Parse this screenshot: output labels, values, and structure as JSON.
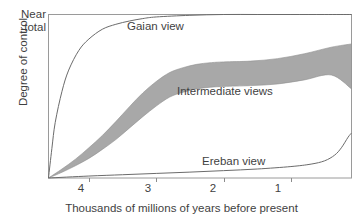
{
  "chart_data": {
    "type": "line",
    "title": "",
    "xlabel": "Thousands of millions of years before present",
    "ylabel": "Degree of control",
    "y_top_label": "Near total",
    "xticks": [
      4,
      3,
      2,
      1
    ],
    "xtick_labels": [
      "4",
      "3",
      "2",
      "1"
    ],
    "x_axis_direction": "decreasing",
    "xlim": [
      4.6,
      0.1
    ],
    "ylim": [
      0,
      1
    ],
    "grid": false,
    "legend_position": "inline-annotations",
    "colors": {
      "band_fill": "#a8a8a8",
      "curve_stroke": "#6b6b6b",
      "axis": "#8c8c8c",
      "text": "#3f3f3f",
      "background": "#ffffff"
    },
    "series": [
      {
        "name": "Gaian view",
        "label": "Gaian view",
        "type": "line",
        "x": [
          4.6,
          4.55,
          4.5,
          4.4,
          4.3,
          4.15,
          4.0,
          3.8,
          3.6,
          3.4,
          3.2,
          3.0,
          2.5,
          2.0,
          1.5,
          1.0,
          0.5,
          0.1
        ],
        "y": [
          0.0,
          0.18,
          0.34,
          0.53,
          0.66,
          0.78,
          0.85,
          0.91,
          0.94,
          0.96,
          0.975,
          0.985,
          0.995,
          1.0,
          1.0,
          1.0,
          1.0,
          1.0
        ]
      },
      {
        "name": "Intermediate views",
        "label": "Intermediate views",
        "type": "band",
        "x": [
          4.6,
          4.4,
          4.2,
          4.0,
          3.8,
          3.6,
          3.4,
          3.2,
          3.0,
          2.8,
          2.6,
          2.4,
          2.2,
          2.0,
          1.6,
          1.2,
          0.8,
          0.4,
          0.1
        ],
        "y_upper": [
          0.0,
          0.055,
          0.115,
          0.185,
          0.26,
          0.345,
          0.435,
          0.52,
          0.59,
          0.645,
          0.675,
          0.695,
          0.705,
          0.71,
          0.715,
          0.73,
          0.76,
          0.8,
          0.82
        ],
        "y_lower": [
          0.0,
          0.035,
          0.075,
          0.12,
          0.175,
          0.235,
          0.305,
          0.375,
          0.44,
          0.495,
          0.525,
          0.545,
          0.555,
          0.56,
          0.565,
          0.575,
          0.6,
          0.63,
          0.545
        ]
      },
      {
        "name": "Ereban view",
        "label": "Ereban view",
        "type": "line",
        "x": [
          4.6,
          4.0,
          3.5,
          3.0,
          2.5,
          2.0,
          1.5,
          1.0,
          0.7,
          0.5,
          0.35,
          0.25,
          0.15,
          0.1
        ],
        "y": [
          0.0,
          0.012,
          0.02,
          0.028,
          0.036,
          0.045,
          0.055,
          0.07,
          0.085,
          0.105,
          0.14,
          0.185,
          0.25,
          0.275
        ]
      }
    ]
  }
}
